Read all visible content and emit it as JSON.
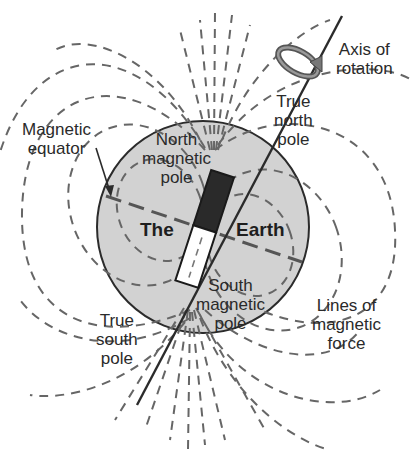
{
  "diagram": {
    "colors": {
      "earth_fill": "#cfcfcf",
      "outline": "#2b2b2b",
      "field_line": "#6a6a6a",
      "magnet_north": "#2a2a2a",
      "magnet_south": "#ffffff",
      "background": "#ffffff"
    },
    "labels": {
      "magnetic_equator": [
        "Magnetic",
        "equator"
      ],
      "north_magnetic_pole": [
        "North",
        "magnetic",
        "pole"
      ],
      "the": "The",
      "earth": "Earth",
      "south_magnetic_pole": [
        "South",
        "magnetic",
        "pole"
      ],
      "true_north_pole": [
        "True",
        "north",
        "pole"
      ],
      "axis_of_rotation": [
        "Axis of",
        "rotation"
      ],
      "true_south_pole": [
        "True",
        "south",
        "pole"
      ],
      "lines_of_magnetic_force": [
        "Lines of",
        "magnetic",
        "force"
      ]
    }
  }
}
